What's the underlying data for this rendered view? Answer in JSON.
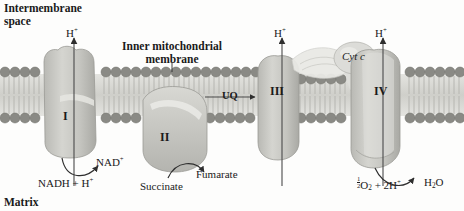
{
  "diagram": {
    "type": "biology-cell-diagram",
    "colors": {
      "background": "#fdfdfc",
      "membrane_head": "#8c8c8c",
      "membrane_tail": "#d9d9d4",
      "complex_fill": "#c9c9c4",
      "complex_stroke": "#9a9a95",
      "text": "#1a1a1a",
      "arrow": "#3a3a3a"
    }
  },
  "regions": {
    "intermembrane_space_line1": "Intermembrane",
    "intermembrane_space_line2": "space",
    "matrix": "Matrix"
  },
  "membrane": {
    "label_line1": "Inner mitochondrial",
    "label_line2": "membrane"
  },
  "complexes": [
    {
      "id": "I",
      "label": "I"
    },
    {
      "id": "II",
      "label": "II"
    },
    {
      "id": "III",
      "label": "III"
    },
    {
      "id": "IV",
      "label": "IV"
    }
  ],
  "carriers": [
    {
      "id": "UQ",
      "label": "UQ"
    },
    {
      "id": "cytc",
      "label": "Cyt c"
    }
  ],
  "proton_arrows": [
    {
      "complex": "I",
      "label_main": "H",
      "label_sup": "+"
    },
    {
      "complex": "III",
      "label_main": "H",
      "label_sup": "+"
    },
    {
      "complex": "IV",
      "label_main": "H",
      "label_sup": "+"
    }
  ],
  "reactions": {
    "complex_I": {
      "substrate_main": "NADH + H",
      "substrate_sup": "+",
      "product_main": "NAD",
      "product_sup": "+"
    },
    "complex_II": {
      "substrate": "Succinate",
      "product": "Fumarate"
    },
    "complex_IV": {
      "oxygen_numerator": "1",
      "oxygen_denominator": "2",
      "oxygen_main": "O",
      "oxygen_sub": "2",
      "protons_main": " + 2H",
      "protons_sup": "+",
      "water_main": "H",
      "water_sub": "2",
      "water_tail": "O"
    }
  }
}
